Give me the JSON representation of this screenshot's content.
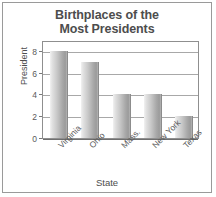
{
  "chart_data": {
    "type": "bar",
    "title": "Birthplaces of the Most Presidents",
    "title_lines": [
      "Birthplaces of the",
      "Most Presidents"
    ],
    "categories": [
      "Virginia",
      "Ohio",
      "Mass.",
      "New York",
      "Texas"
    ],
    "values": [
      8,
      7,
      4,
      4,
      2
    ],
    "xlabel": "State",
    "ylabel": "President",
    "ylim": [
      0,
      9
    ],
    "yticks": [
      0,
      2,
      4,
      6,
      8
    ],
    "ytick_labels": [
      "0",
      "2",
      "4",
      "6",
      "8"
    ],
    "grid": "horizontal",
    "legend": "none",
    "bar_fill": "#b4b4b4",
    "bar_edge": "#8c8c8c",
    "axis_color": "#8f8f8f",
    "grid_color": "#a8a8a8",
    "text_color": "#4d4d4d",
    "frame_color": "#9a9a9a",
    "background": "#ffffff"
  }
}
